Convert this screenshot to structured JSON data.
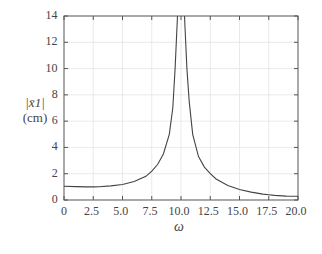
{
  "chart_data": {
    "type": "line",
    "title": "",
    "xlabel": "ω",
    "ylabel_line1": "|x̄1|",
    "ylabel_line2": "(cm)",
    "xlim": [
      0,
      20
    ],
    "ylim": [
      0,
      14
    ],
    "grid": true,
    "legend": null,
    "x_ticks": [
      "0",
      "2.5",
      "5.0",
      "7.5",
      "10.0",
      "12.5",
      "15.0",
      "17.5",
      "20.0"
    ],
    "y_ticks": [
      "0",
      "2",
      "4",
      "6",
      "8",
      "10",
      "12",
      "14"
    ],
    "series": [
      {
        "name": "|x̄1|",
        "color": "#444444",
        "x": [
          0,
          1,
          2,
          2.5,
          3,
          4,
          5,
          6,
          7,
          7.5,
          8,
          8.5,
          9,
          9.3,
          9.5,
          9.6,
          9.7,
          10.3,
          10.4,
          10.5,
          10.7,
          11,
          11.5,
          12,
          12.5,
          13,
          14,
          15,
          16,
          17,
          17.5,
          18,
          19,
          20
        ],
        "values": [
          1.05,
          1.02,
          1.0,
          1.0,
          1.01,
          1.07,
          1.18,
          1.4,
          1.8,
          2.2,
          2.7,
          3.5,
          5.0,
          7.0,
          10.0,
          12.0,
          14.0,
          14.0,
          12.0,
          10.0,
          7.5,
          5.0,
          3.3,
          2.5,
          2.0,
          1.6,
          1.1,
          0.8,
          0.6,
          0.45,
          0.4,
          0.35,
          0.3,
          0.28
        ]
      }
    ]
  }
}
